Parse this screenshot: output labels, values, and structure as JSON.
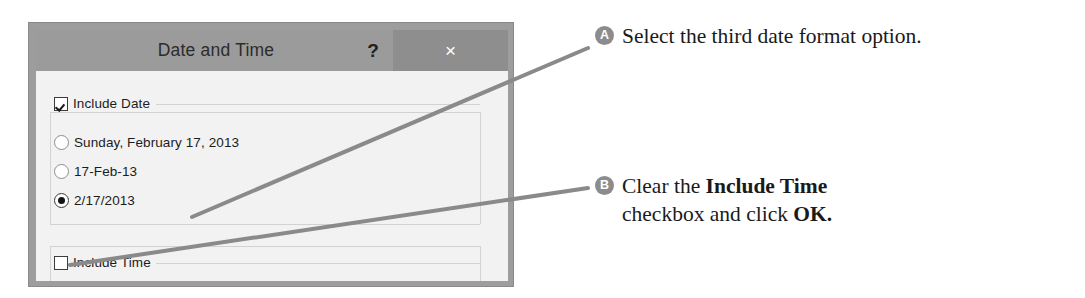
{
  "figure": {
    "background_color": "#ffffff",
    "width": 1085,
    "height": 298
  },
  "dialog": {
    "title": "Date and Time",
    "titlebar_color": "#9b9b9b",
    "frame_color": "#9d9d9d",
    "body_color": "#f2f2f2",
    "help_button_label": "?",
    "close_button_label": "×",
    "close_button_color": "#8e8e8e",
    "include_date": {
      "label": "Include Date",
      "checked": true
    },
    "date_format_options": [
      {
        "label": "Sunday, February 17, 2013",
        "selected": false
      },
      {
        "label": "17-Feb-13",
        "selected": false
      },
      {
        "label": "2/17/2013",
        "selected": true
      }
    ],
    "include_time": {
      "label": "Include Time",
      "checked": false
    }
  },
  "callouts": [
    {
      "badge": "A",
      "badge_color": "#8c8c8c",
      "text_parts": [
        {
          "text": "Select the third date format option.",
          "bold": false
        }
      ]
    },
    {
      "badge": "B",
      "badge_color": "#8c8c8c",
      "text_parts": [
        {
          "text": "Clear the ",
          "bold": false
        },
        {
          "text": "Include Time",
          "bold": true
        },
        {
          "text": "\ncheckbox and click ",
          "bold": false
        },
        {
          "text": "OK.",
          "bold": true
        }
      ]
    }
  ],
  "leader_lines": [
    {
      "name": "leader-line-a",
      "from_x": 192,
      "from_y": 217,
      "to_x": 588,
      "to_y": 48,
      "color": "#8a8a8a",
      "stroke_width": 4
    },
    {
      "name": "leader-line-b",
      "from_x": 70,
      "from_y": 265,
      "to_x": 588,
      "to_y": 188,
      "color": "#8a8a8a",
      "stroke_width": 4
    }
  ]
}
